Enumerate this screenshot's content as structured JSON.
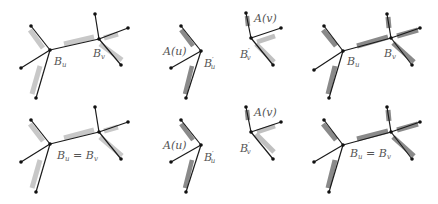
{
  "colors": {
    "edge": "#1a1a1a",
    "shadow_light": "#c8c8c8",
    "shadow_dark": "#8a8a8a",
    "node": "#111111",
    "label": "#555555"
  },
  "panels": [
    {
      "id": "top-1",
      "labels": {
        "bu": "B",
        "bu_sub": "u",
        "bv": "B",
        "bv_sub": "v"
      }
    },
    {
      "id": "top-2",
      "labels": {
        "au": "A(u)",
        "bu": "B",
        "bu_sub": "u",
        "bu_prime": "′",
        "av": "A(v)",
        "bv": "B",
        "bv_sub": "v",
        "bv_prime": "′"
      }
    },
    {
      "id": "top-3",
      "labels": {
        "bu": "B",
        "bu_sub": "u",
        "bv": "B",
        "bv_sub": "v"
      }
    },
    {
      "id": "bottom-1",
      "labels": {
        "eq_left": "B",
        "eq_left_sub": "u",
        "eq": " = ",
        "eq_right": "B",
        "eq_right_sub": "v"
      }
    },
    {
      "id": "bottom-2",
      "labels": {
        "au": "A(u)",
        "bu": "B",
        "bu_sub": "u",
        "bu_prime": "′",
        "av": "A(v)",
        "bv": "B",
        "bv_sub": "v",
        "bv_prime": "′"
      }
    },
    {
      "id": "bottom-3",
      "labels": {
        "eq_left": "B",
        "eq_left_sub": "u",
        "eq": " = ",
        "eq_right": "B",
        "eq_right_sub": "v"
      }
    }
  ]
}
